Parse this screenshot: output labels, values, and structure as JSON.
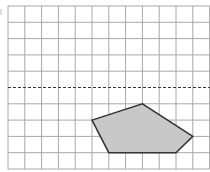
{
  "figure": {
    "type": "grid-polygon-reflection",
    "cropped_label": "(",
    "grid": {
      "origin_x": 8,
      "origin_y": 6,
      "cell_w": 16.8,
      "cell_h": 16.3,
      "cols": 12,
      "rows": 10,
      "line_color": "#a8a8a8",
      "dashed_row": 5,
      "dashed_color": "#333333"
    },
    "polygon": {
      "vertices_grid": [
        [
          5,
          7
        ],
        [
          8,
          6
        ],
        [
          11,
          8
        ],
        [
          10,
          9
        ],
        [
          6,
          9
        ]
      ],
      "fill": "#c8c8c8",
      "stroke": "#333333"
    }
  },
  "colors": {
    "background": "#ffffff",
    "grid_line": "#a8a8a8",
    "mirror_line": "#333333",
    "shape_fill": "#c8c8c8",
    "shape_stroke": "#333333"
  }
}
